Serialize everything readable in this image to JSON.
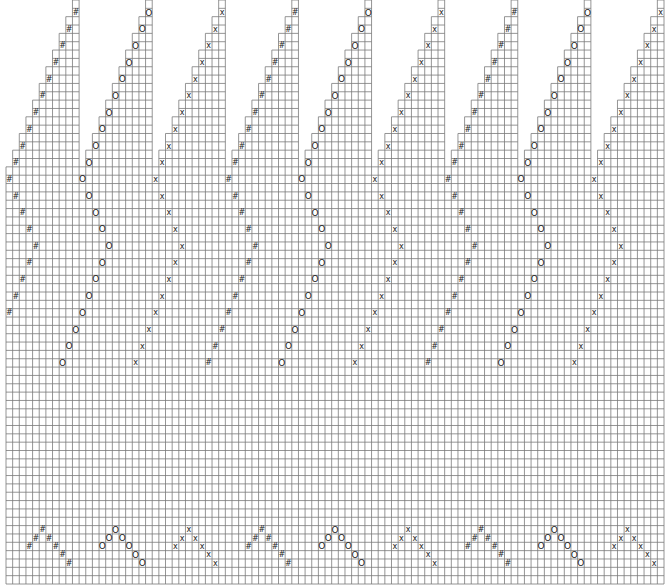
{
  "grid": {
    "columns": 99,
    "rows": 70,
    "origin_x": 6,
    "origin_y": 0,
    "width": 658,
    "height": 584,
    "line_color": "#7a7a7a",
    "background": "#ffffff",
    "symbol_color": "#222222"
  },
  "symbols": {
    "hash": "#",
    "circle": "O",
    "cross": "x"
  },
  "sections": [
    {
      "symbol": "hash",
      "top_col": 10
    },
    {
      "symbol": "circle",
      "top_col": 21
    },
    {
      "symbol": "cross",
      "top_col": 32
    },
    {
      "symbol": "hash",
      "top_col": 43
    },
    {
      "symbol": "circle",
      "top_col": 54
    },
    {
      "symbol": "cross",
      "top_col": 65
    },
    {
      "symbol": "hash",
      "top_col": 76
    },
    {
      "symbol": "circle",
      "top_col": 87
    },
    {
      "symbol": "cross",
      "top_col": 98
    }
  ],
  "staircase": {
    "section_width": 11,
    "rows_per_step": 2
  },
  "path_offsets": [
    [
      1,
      0
    ],
    [
      3,
      -1
    ],
    [
      5,
      -2
    ],
    [
      7,
      -3
    ],
    [
      9,
      -4
    ],
    [
      11,
      -5
    ],
    [
      13,
      -6
    ],
    [
      15,
      -7
    ],
    [
      17,
      -8
    ],
    [
      19,
      -9
    ],
    [
      21,
      -10
    ],
    [
      23,
      -9
    ],
    [
      25,
      -8
    ],
    [
      27,
      -7
    ],
    [
      29,
      -6
    ],
    [
      31,
      -7
    ],
    [
      33,
      -8
    ],
    [
      35,
      -9
    ],
    [
      37,
      -10
    ],
    [
      39,
      -11
    ],
    [
      41,
      -12
    ],
    [
      43,
      -13
    ]
  ],
  "motif": {
    "base_col_offset": -5,
    "cells": [
      [
        63,
        0
      ],
      [
        64,
        -1
      ],
      [
        64,
        1
      ],
      [
        65,
        -2
      ],
      [
        65,
        2
      ],
      [
        66,
        3
      ],
      [
        67,
        4
      ]
    ]
  }
}
